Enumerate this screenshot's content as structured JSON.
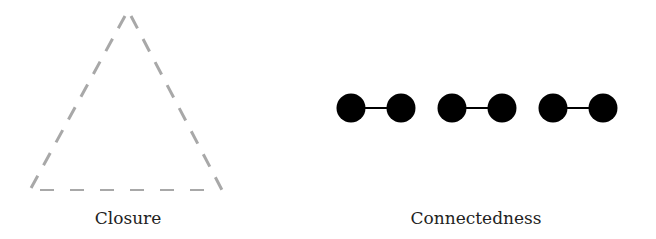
{
  "figures": [
    {
      "id": "closure",
      "label": "Closure",
      "shape": "dashed-triangle",
      "stroke_color": "#a8a8a8",
      "vertices": [
        [
          127,
          15
        ],
        [
          30,
          190
        ],
        [
          222,
          190
        ]
      ]
    },
    {
      "id": "connectedness",
      "label": "Connectedness",
      "shape": "connected-dot-pairs",
      "fill_color": "#000000",
      "pairs": [
        {
          "left_cx": 351,
          "right_cx": 401,
          "cy": 108
        },
        {
          "left_cx": 452,
          "right_cx": 502,
          "cy": 108
        },
        {
          "left_cx": 553,
          "right_cx": 603,
          "cy": 108
        }
      ],
      "dot_radius": 14.5
    }
  ]
}
